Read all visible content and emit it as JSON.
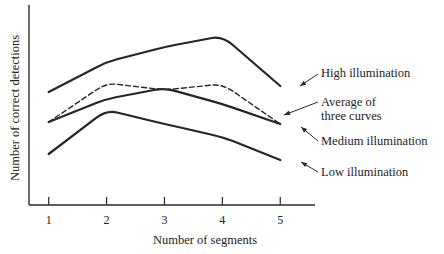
{
  "chart_data": {
    "type": "line",
    "title": "",
    "xlabel": "Number of segments",
    "ylabel": "Number of correct detections",
    "x": [
      1,
      2,
      3,
      4,
      5
    ],
    "x_tick_labels": [
      "1",
      "2",
      "3",
      "4",
      "5"
    ],
    "y_tick_labels": [],
    "xlim": [
      0.66,
      5.6
    ],
    "ylim": [
      0,
      10
    ],
    "y_units_note": "arbitrary (no y tick labels shown)",
    "grid": false,
    "legend": "none (direct annotations at right)",
    "series": [
      {
        "name": "High illumination",
        "style": "solid",
        "values": [
          5.65,
          7.15,
          7.9,
          8.45,
          5.95
        ],
        "annotation": [
          "High illumination"
        ]
      },
      {
        "name": "Average of three curves",
        "style": "dashed",
        "values": [
          4.15,
          6.1,
          5.75,
          6.05,
          4.05
        ],
        "annotation": [
          "Average of",
          "three curves"
        ]
      },
      {
        "name": "Medium illumination",
        "style": "solid",
        "values": [
          4.15,
          5.3,
          5.85,
          5.05,
          4.05
        ],
        "annotation": [
          "Medium illumination"
        ]
      },
      {
        "name": "Low illumination",
        "style": "solid",
        "values": [
          2.55,
          4.75,
          4.05,
          3.4,
          2.25
        ],
        "annotation": [
          "Low illumination"
        ]
      }
    ]
  }
}
